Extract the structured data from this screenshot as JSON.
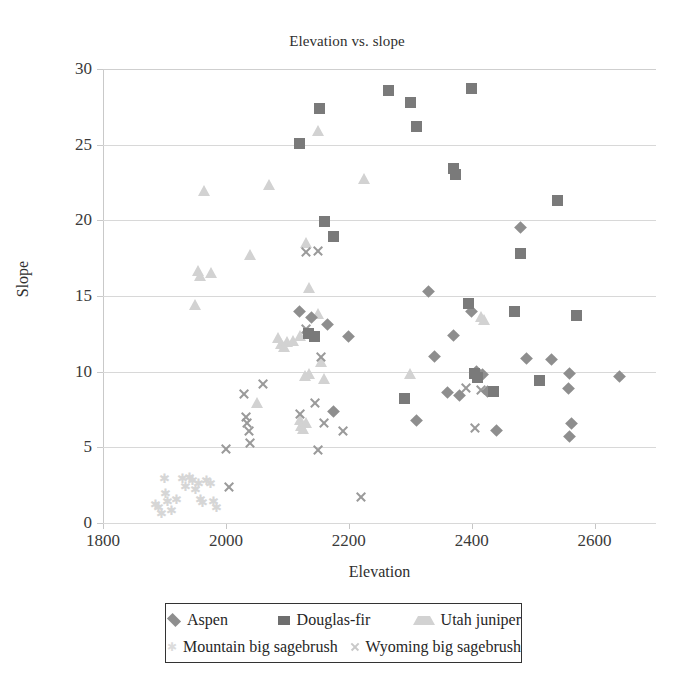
{
  "chart_data": {
    "type": "scatter",
    "title": "Elevation vs. slope",
    "xlabel": "Elevation",
    "ylabel": "Slope",
    "xlim": [
      1800,
      2700
    ],
    "ylim": [
      0,
      30
    ],
    "xticks": [
      "1800",
      "2000",
      "2200",
      "2400",
      "2600"
    ],
    "xtick_values": [
      1800,
      2000,
      2200,
      2400,
      2600
    ],
    "yticks": [
      "0",
      "5",
      "10",
      "15",
      "20",
      "25",
      "30"
    ],
    "ytick_values": [
      0,
      5,
      10,
      15,
      20,
      25,
      30
    ],
    "grid": "horizontal",
    "legend_position": "bottom",
    "series": [
      {
        "name": "Aspen",
        "marker": "diamond",
        "color": "#8e8e8e",
        "points": [
          [
            2120,
            14.0
          ],
          [
            2140,
            13.6
          ],
          [
            2165,
            13.1
          ],
          [
            2175,
            7.4
          ],
          [
            2200,
            12.3
          ],
          [
            2330,
            15.3
          ],
          [
            2370,
            12.4
          ],
          [
            2400,
            14.0
          ],
          [
            2408,
            10.0
          ],
          [
            2412,
            9.7
          ],
          [
            2418,
            9.8
          ],
          [
            2425,
            8.7
          ],
          [
            2440,
            6.1
          ],
          [
            2360,
            8.6
          ],
          [
            2340,
            11.0
          ],
          [
            2380,
            8.4
          ],
          [
            2480,
            19.5
          ],
          [
            2490,
            10.9
          ],
          [
            2530,
            10.8
          ],
          [
            2560,
            9.9
          ],
          [
            2558,
            8.9
          ],
          [
            2562,
            6.6
          ],
          [
            2560,
            5.7
          ],
          [
            2640,
            9.7
          ],
          [
            2310,
            6.8
          ]
        ]
      },
      {
        "name": "Douglas-fir",
        "marker": "square",
        "color": "#7a7a7a",
        "points": [
          [
            2120,
            25.1
          ],
          [
            2152,
            27.4
          ],
          [
            2160,
            19.9
          ],
          [
            2175,
            18.9
          ],
          [
            2265,
            28.6
          ],
          [
            2300,
            27.8
          ],
          [
            2310,
            26.2
          ],
          [
            2400,
            28.7
          ],
          [
            2370,
            23.4
          ],
          [
            2373,
            23.0
          ],
          [
            2290,
            8.2
          ],
          [
            2395,
            14.5
          ],
          [
            2405,
            9.9
          ],
          [
            2410,
            9.6
          ],
          [
            2435,
            8.7
          ],
          [
            2480,
            17.8
          ],
          [
            2470,
            14.0
          ],
          [
            2510,
            9.4
          ],
          [
            2540,
            21.3
          ],
          [
            2570,
            13.7
          ],
          [
            2135,
            12.5
          ],
          [
            2145,
            12.3
          ]
        ]
      },
      {
        "name": "Utah juniper",
        "marker": "triangle",
        "color": "#d2d2d2",
        "points": [
          [
            1965,
            22.0
          ],
          [
            2040,
            17.8
          ],
          [
            2070,
            22.4
          ],
          [
            2150,
            26.0
          ],
          [
            2225,
            22.8
          ],
          [
            2130,
            18.6
          ],
          [
            2135,
            15.6
          ],
          [
            2150,
            13.9
          ],
          [
            1955,
            16.7
          ],
          [
            1958,
            16.4
          ],
          [
            1975,
            16.6
          ],
          [
            1950,
            14.5
          ],
          [
            2085,
            12.3
          ],
          [
            2090,
            11.9
          ],
          [
            2095,
            11.7
          ],
          [
            2100,
            12.0
          ],
          [
            2110,
            12.1
          ],
          [
            2120,
            12.4
          ],
          [
            2155,
            10.7
          ],
          [
            2160,
            9.6
          ],
          [
            2135,
            9.9
          ],
          [
            2128,
            9.8
          ],
          [
            2050,
            8.0
          ],
          [
            2120,
            6.9
          ],
          [
            2122,
            6.5
          ],
          [
            2125,
            6.3
          ],
          [
            2130,
            6.7
          ],
          [
            2300,
            9.9
          ],
          [
            2415,
            13.7
          ],
          [
            2420,
            13.5
          ]
        ]
      },
      {
        "name": "Mountain big sagebrush",
        "marker": "star",
        "color": "#d6d6d6",
        "points": [
          [
            1885,
            1.2
          ],
          [
            1890,
            1.0
          ],
          [
            1895,
            0.6
          ],
          [
            1900,
            2.9
          ],
          [
            1905,
            1.4
          ],
          [
            1920,
            1.5
          ],
          [
            1930,
            2.9
          ],
          [
            1935,
            2.4
          ],
          [
            1945,
            2.8
          ],
          [
            1950,
            2.2
          ],
          [
            1955,
            2.6
          ],
          [
            1958,
            1.5
          ],
          [
            1962,
            1.3
          ],
          [
            1968,
            2.8
          ],
          [
            1975,
            2.6
          ],
          [
            1980,
            1.4
          ],
          [
            1985,
            1.0
          ],
          [
            1940,
            3.0
          ],
          [
            1912,
            0.8
          ],
          [
            1902,
            1.9
          ]
        ]
      },
      {
        "name": "Wyoming big sagebrush",
        "marker": "cross",
        "color": "#9a9a9a",
        "points": [
          [
            2000,
            4.9
          ],
          [
            2030,
            8.5
          ],
          [
            2032,
            7.0
          ],
          [
            2035,
            6.6
          ],
          [
            2038,
            6.1
          ],
          [
            2040,
            5.3
          ],
          [
            2060,
            9.2
          ],
          [
            2130,
            12.8
          ],
          [
            2155,
            11.0
          ],
          [
            2145,
            7.9
          ],
          [
            2120,
            7.2
          ],
          [
            2160,
            6.6
          ],
          [
            2150,
            4.8
          ],
          [
            2190,
            6.1
          ],
          [
            2220,
            1.7
          ],
          [
            2005,
            2.4
          ],
          [
            2390,
            8.9
          ],
          [
            2415,
            8.8
          ],
          [
            2405,
            6.3
          ],
          [
            2130,
            17.9
          ],
          [
            2150,
            18.0
          ]
        ]
      }
    ]
  },
  "legend": {
    "entries": [
      {
        "label": "Aspen",
        "marker": "diamond-icon"
      },
      {
        "label": "Douglas-fir",
        "marker": "square-icon"
      },
      {
        "label": "Utah juniper",
        "marker": "triangle-icon"
      },
      {
        "label": "Mountain big sagebrush",
        "marker": "star-icon"
      },
      {
        "label": "Wyoming big sagebrush",
        "marker": "cross-icon"
      }
    ]
  }
}
